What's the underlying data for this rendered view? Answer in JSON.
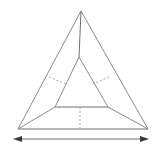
{
  "figure": {
    "type": "geometry-diagram",
    "canvas": {
      "width": 156,
      "height": 151,
      "background": "#ffffff"
    },
    "colors": {
      "visible_edge": "#8a8a8a",
      "hidden_edge": "#a8a8a8",
      "dimension_line": "#6b6b6b",
      "arrow_head": "#3a3a3a"
    },
    "vertices": {
      "apex": {
        "label": "",
        "x": 81,
        "y": 11
      },
      "interior_top": {
        "label": "",
        "x": 78,
        "y": 57
      },
      "base_left": {
        "label": "",
        "x": 18,
        "y": 129
      },
      "base_right": {
        "label": "",
        "x": 148,
        "y": 129
      },
      "inner_left": {
        "label": "",
        "x": 55,
        "y": 107
      },
      "inner_right": {
        "label": "",
        "x": 108,
        "y": 107
      },
      "inner_center": {
        "label": "",
        "x": 80,
        "y": 107
      },
      "back_base": {
        "label": "",
        "x": 80,
        "y": 128
      }
    },
    "edges": [
      {
        "name": "apex-to-base-left",
        "style": "solid"
      },
      {
        "name": "apex-to-base-right",
        "style": "solid"
      },
      {
        "name": "base-left-to-base-right",
        "style": "solid"
      },
      {
        "name": "apex-to-interior-top",
        "style": "solid"
      },
      {
        "name": "interior-top-to-inner-left",
        "style": "solid"
      },
      {
        "name": "interior-top-to-inner-right",
        "style": "solid"
      },
      {
        "name": "inner-left-to-inner-right",
        "style": "solid"
      },
      {
        "name": "base-left-to-inner-left",
        "style": "solid"
      },
      {
        "name": "base-right-to-inner-right",
        "style": "solid"
      },
      {
        "name": "left-hidden-cross",
        "style": "dashed"
      },
      {
        "name": "right-hidden-cross",
        "style": "dashed"
      },
      {
        "name": "center-vertical-hidden",
        "style": "dashed"
      }
    ],
    "dimension": {
      "name": "base-width",
      "label": "",
      "orientation": "horizontal",
      "x_start": 14,
      "x_end": 148,
      "y": 139,
      "arrow_both_ends": true
    }
  }
}
